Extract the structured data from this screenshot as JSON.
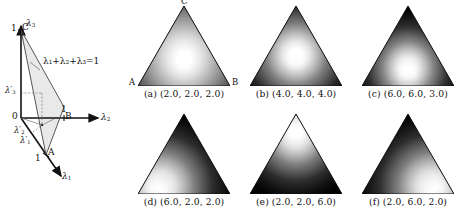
{
  "figure": {
    "type": "dirichlet-density-simplex-figure",
    "background": "#ffffff",
    "ink": "#111111"
  },
  "simplex_diagram": {
    "name": "barycentric-coordinate-simplex",
    "origin_label": "0",
    "equation": "λ₁+λ₂+λ₃=1",
    "axes": [
      {
        "id": "lambda1",
        "label": "λ",
        "subscript": "1",
        "tick": "1",
        "vertex": "A",
        "direction": "down-right-front"
      },
      {
        "id": "lambda2",
        "label": "λ",
        "subscript": "2",
        "tick": "1",
        "vertex": "B",
        "direction": "right"
      },
      {
        "id": "lambda3",
        "label": "λ",
        "subscript": "3",
        "tick": "1",
        "vertex": "C",
        "direction": "up"
      }
    ],
    "projections": [
      {
        "id": "lambda1-prime",
        "label": "λ",
        "subscript": "1",
        "prime": "′"
      },
      {
        "id": "lambda2-prime",
        "label": "λ",
        "subscript": "2",
        "prime": "′"
      },
      {
        "id": "lambda3-prime",
        "label": "λ",
        "subscript": "3",
        "prime": "′"
      }
    ],
    "vertex_labels": {
      "A": "A",
      "B": "B",
      "C": "C"
    },
    "tick_labels": {
      "lambda1": "1",
      "lambda2": "1",
      "lambda3": "1"
    },
    "plane_fill": "#e8e8e8"
  },
  "panels": [
    {
      "id": "a",
      "tag": "(a)",
      "params": "(2.0,  2.0,  2.0)",
      "alpha": [
        2.0,
        2.0,
        2.0
      ],
      "vertex_labels": {
        "top": "C",
        "left": "A",
        "right": "B"
      },
      "show_vertex_labels": true,
      "mode": {
        "x": 50,
        "y": 62
      },
      "spread": 118,
      "peak": 1.0
    },
    {
      "id": "b",
      "tag": "(b)",
      "params": "(4.0,  4.0,  4.0)",
      "alpha": [
        4.0,
        4.0,
        4.0
      ],
      "vertex_labels": {
        "top": "",
        "left": "",
        "right": ""
      },
      "show_vertex_labels": false,
      "mode": {
        "x": 50,
        "y": 60
      },
      "spread": 74,
      "peak": 1.0
    },
    {
      "id": "c",
      "tag": "(c)",
      "params": "(6.0,  6.0,  3.0)",
      "alpha": [
        6.0,
        6.0,
        3.0
      ],
      "vertex_labels": {
        "top": "",
        "left": "",
        "right": ""
      },
      "show_vertex_labels": false,
      "mode": {
        "x": 50,
        "y": 76
      },
      "spread": 62,
      "peak": 1.0
    },
    {
      "id": "d",
      "tag": "(d)",
      "params": "(6.0,  2.0,  2.0)",
      "alpha": [
        6.0,
        2.0,
        2.0
      ],
      "vertex_labels": {
        "top": "",
        "left": "",
        "right": ""
      },
      "show_vertex_labels": false,
      "mode": {
        "x": 26,
        "y": 88
      },
      "spread": 78,
      "peak": 1.0
    },
    {
      "id": "e",
      "tag": "(e)",
      "params": "(2.0,  2.0,  6.0)",
      "alpha": [
        2.0,
        2.0,
        6.0
      ],
      "vertex_labels": {
        "top": "",
        "left": "",
        "right": ""
      },
      "show_vertex_labels": false,
      "mode": {
        "x": 50,
        "y": 26
      },
      "spread": 72,
      "peak": 1.0
    },
    {
      "id": "f",
      "tag": "(f)",
      "params": "(2.0,  6.0,  2.0)",
      "alpha": [
        2.0,
        6.0,
        2.0
      ],
      "vertex_labels": {
        "top": "",
        "left": "",
        "right": ""
      },
      "show_vertex_labels": false,
      "mode": {
        "x": 74,
        "y": 88
      },
      "spread": 78,
      "peak": 1.0
    }
  ],
  "chart_data": {
    "type": "heatmap",
    "title": "",
    "colormap": "grayscale (black = low density, white = high density)",
    "axis_vertices": [
      "A",
      "B",
      "C"
    ],
    "xlabel": "",
    "ylabel": "",
    "legend_position": "none",
    "grid": false,
    "series": [
      {
        "name": "(a)",
        "alpha": [
          2.0,
          2.0,
          2.0
        ],
        "mode_barycentric": [
          0.333,
          0.333,
          0.333
        ],
        "concentration": 6.0
      },
      {
        "name": "(b)",
        "alpha": [
          4.0,
          4.0,
          4.0
        ],
        "mode_barycentric": [
          0.333,
          0.333,
          0.333
        ],
        "concentration": 12.0
      },
      {
        "name": "(c)",
        "alpha": [
          6.0,
          6.0,
          3.0
        ],
        "mode_barycentric": [
          0.417,
          0.417,
          0.167
        ],
        "concentration": 15.0
      },
      {
        "name": "(d)",
        "alpha": [
          6.0,
          2.0,
          2.0
        ],
        "mode_barycentric": [
          0.714,
          0.143,
          0.143
        ],
        "concentration": 10.0
      },
      {
        "name": "(e)",
        "alpha": [
          2.0,
          2.0,
          6.0
        ],
        "mode_barycentric": [
          0.143,
          0.143,
          0.714
        ],
        "concentration": 10.0
      },
      {
        "name": "(f)",
        "alpha": [
          2.0,
          6.0,
          2.0
        ],
        "mode_barycentric": [
          0.143,
          0.714,
          0.143
        ],
        "concentration": 10.0
      }
    ]
  }
}
